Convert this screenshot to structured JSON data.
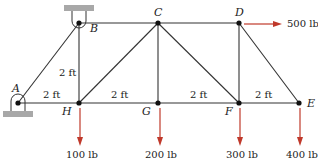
{
  "diagram": {
    "type": "truss",
    "joints": {
      "A": {
        "label": "A",
        "x": 18,
        "y": 103
      },
      "B": {
        "label": "B",
        "x": 79,
        "y": 23
      },
      "C": {
        "label": "C",
        "x": 158,
        "y": 23
      },
      "D": {
        "label": "D",
        "x": 239,
        "y": 23
      },
      "E": {
        "label": "E",
        "x": 299,
        "y": 103
      },
      "F": {
        "label": "F",
        "x": 239,
        "y": 103
      },
      "G": {
        "label": "G",
        "x": 158,
        "y": 103
      },
      "H": {
        "label": "H",
        "x": 79,
        "y": 103
      }
    },
    "members": [
      [
        "A",
        "B"
      ],
      [
        "A",
        "H"
      ],
      [
        "B",
        "H"
      ],
      [
        "B",
        "C"
      ],
      [
        "H",
        "C"
      ],
      [
        "H",
        "G"
      ],
      [
        "C",
        "G"
      ],
      [
        "C",
        "F"
      ],
      [
        "G",
        "F"
      ],
      [
        "C",
        "D"
      ],
      [
        "D",
        "F"
      ],
      [
        "D",
        "E"
      ],
      [
        "F",
        "E"
      ]
    ],
    "dimensions": {
      "bh": "2 ft",
      "ah": "2 ft",
      "hg": "2 ft",
      "gf": "2 ft",
      "fe": "2 ft"
    },
    "loads": {
      "d_horizontal": "500 lb",
      "h": "100 lb",
      "g": "200 lb",
      "f": "300 lb",
      "e": "400 lb"
    },
    "supports": {
      "A": "pin-ground",
      "B": "pin-ceiling"
    },
    "colors": {
      "member": "#333333",
      "force": "#c0392b",
      "support": "#a8a8a8"
    }
  }
}
